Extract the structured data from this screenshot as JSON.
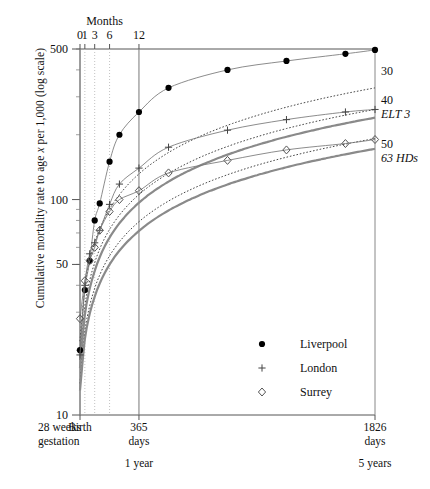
{
  "figure": {
    "y_axis_label_pre": "Cumulative mortality rate to age ",
    "y_axis_label_var": "x",
    "y_axis_label_post": " per 1,000 (log scale)",
    "top_axis_title": "Months"
  },
  "chart_data": {
    "type": "line",
    "title": "",
    "xlabel": "Months",
    "ylabel": "Cumulative mortality rate to age x per 1,000 (log scale)",
    "yscale": "log",
    "ylim": [
      10,
      500
    ],
    "ytick_labels": [
      "500",
      "100",
      "50",
      "10"
    ],
    "ytick_values": [
      500,
      100,
      50,
      10
    ],
    "xscale": "linear-days",
    "xlim_days": [
      0,
      1826
    ],
    "top_tick_labels": [
      "0",
      "1",
      "3",
      "6",
      "12"
    ],
    "top_tick_days": [
      0,
      30,
      91,
      183,
      365
    ],
    "bottom_ticks": [
      {
        "label_1": "28 weeks",
        "label_2": "gestation",
        "label_3": "",
        "days": -84,
        "pos": "left-edge"
      },
      {
        "label_1": "Birth",
        "label_2": "",
        "label_3": "",
        "days": 0
      },
      {
        "label_1": "365",
        "label_2": "days",
        "label_3": "1 year",
        "days": 365
      },
      {
        "label_1": "1826",
        "label_2": "days",
        "label_3": "5 years",
        "days": 1826
      }
    ],
    "grid": "vertical gridlines at 0,1,3,6,12 months",
    "legend_position": "lower-right inside plot",
    "series": [
      {
        "name": "Liverpool",
        "marker": "filled-circle",
        "linestyle": "thin-solid",
        "points_days_rate": [
          [
            0,
            20
          ],
          [
            30,
            38
          ],
          [
            60,
            52
          ],
          [
            91,
            80
          ],
          [
            122,
            96
          ],
          [
            183,
            150
          ],
          [
            244,
            200
          ],
          [
            365,
            255
          ],
          [
            548,
            330
          ],
          [
            913,
            400
          ],
          [
            1278,
            440
          ],
          [
            1643,
            475
          ],
          [
            1826,
            495
          ]
        ]
      },
      {
        "name": "London",
        "marker": "plus",
        "linestyle": "thin-solid",
        "points_days_rate": [
          [
            0,
            19
          ],
          [
            30,
            40
          ],
          [
            60,
            56
          ],
          [
            91,
            63
          ],
          [
            122,
            72
          ],
          [
            183,
            95
          ],
          [
            244,
            118
          ],
          [
            365,
            140
          ],
          [
            548,
            175
          ],
          [
            913,
            210
          ],
          [
            1278,
            235
          ],
          [
            1643,
            255
          ],
          [
            1826,
            262
          ]
        ]
      },
      {
        "name": "Surrey",
        "marker": "open-diamond",
        "linestyle": "thin-solid",
        "points_days_rate": [
          [
            0,
            28
          ],
          [
            30,
            42
          ],
          [
            60,
            52
          ],
          [
            91,
            60
          ],
          [
            122,
            72
          ],
          [
            183,
            88
          ],
          [
            244,
            100
          ],
          [
            365,
            110
          ],
          [
            548,
            133
          ],
          [
            913,
            152
          ],
          [
            1278,
            170
          ],
          [
            1643,
            182
          ],
          [
            1826,
            190
          ]
        ]
      }
    ],
    "reference_curves": [
      {
        "label": "30",
        "linestyle": "dotted",
        "end_rate": 330
      },
      {
        "label": "40",
        "linestyle": "dotted",
        "end_rate": 262
      },
      {
        "label": "ELT 3",
        "linestyle": "thick-solid-gray",
        "end_rate": 240
      },
      {
        "label": "50",
        "linestyle": "dotted",
        "end_rate": 192
      },
      {
        "label": "63 HDs",
        "linestyle": "thick-solid-gray",
        "end_rate": 172
      }
    ],
    "legend_entries": [
      {
        "marker": "filled-circle",
        "label": "Liverpool"
      },
      {
        "marker": "plus",
        "label": "London"
      },
      {
        "marker": "open-diamond",
        "label": "Surrey"
      }
    ],
    "right_labels": [
      "30",
      "40",
      "ELT 3",
      "50",
      "63 HDs"
    ]
  }
}
